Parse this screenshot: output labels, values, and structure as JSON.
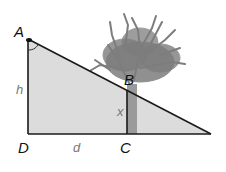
{
  "diagram": {
    "type": "similar-triangles-tree-height",
    "points": {
      "A": {
        "label": "A"
      },
      "B": {
        "label": "B"
      },
      "C": {
        "label": "C"
      },
      "D": {
        "label": "D"
      }
    },
    "variables": {
      "h": "h",
      "x": "x",
      "d": "d"
    },
    "colors": {
      "triangle_fill": "#d9d9d9",
      "lines": "#1a1a1a",
      "tree": "#7a7a7a",
      "trunk": "#8c8c8c"
    }
  }
}
